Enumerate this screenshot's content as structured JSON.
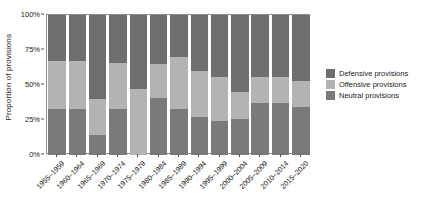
{
  "chart_data": {
    "type": "bar",
    "title": "",
    "subtitle": "",
    "xlabel": "",
    "ylabel": "Proportion of provisions",
    "stacked": true,
    "stack_mode": "percent",
    "ylim": [
      0,
      100
    ],
    "grid": false,
    "legend_position": "right",
    "y_ticks": [
      {
        "value": 0,
        "label": "0%"
      },
      {
        "value": 25,
        "label": "25%"
      },
      {
        "value": 50,
        "label": "50%"
      },
      {
        "value": 75,
        "label": "75%"
      },
      {
        "value": 100,
        "label": "100%"
      }
    ],
    "categories": [
      "1955–1959",
      "1960–1964",
      "1965–1969",
      "1970–1974",
      "1975–1979",
      "1980–1984",
      "1985–1989",
      "1990–1994",
      "1995–1999",
      "2000–2004",
      "2005–2009",
      "2010–2014",
      "2015–2020"
    ],
    "series": [
      {
        "name": "Neutral provisions",
        "color": "#7a7a7a",
        "values": [
          33,
          33,
          14,
          33,
          0,
          41,
          33,
          27,
          24,
          26,
          37,
          37,
          34
        ]
      },
      {
        "name": "Offensive provisions",
        "color": "#b3b3b3",
        "values": [
          34,
          34,
          26,
          33,
          47,
          24,
          37,
          33,
          32,
          19,
          19,
          19,
          19
        ]
      },
      {
        "name": "Defensive provisions",
        "color": "#6e6e6e",
        "values": [
          33,
          33,
          60,
          34,
          53,
          35,
          30,
          40,
          44,
          55,
          44,
          44,
          47
        ]
      }
    ],
    "legend": [
      {
        "label": "Defensive provisions",
        "color": "#6e6e6e"
      },
      {
        "label": "Offensive provisions",
        "color": "#b3b3b3"
      },
      {
        "label": "Neutral provisions",
        "color": "#7a7a7a"
      }
    ]
  }
}
